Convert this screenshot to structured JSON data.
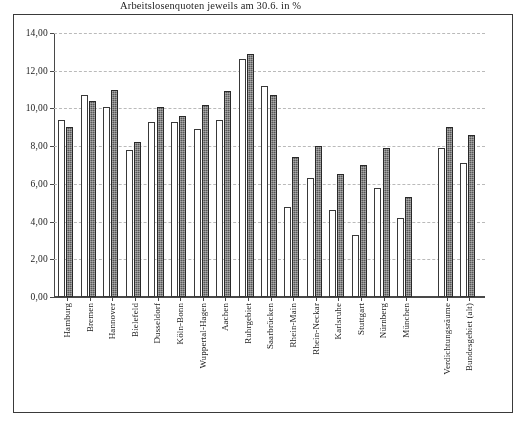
{
  "chart_data": {
    "type": "bar",
    "title": "Arbeitslosenquoten jeweils am 30.6. in %",
    "xlabel": "",
    "ylabel": "",
    "ylim": [
      0.0,
      14.0
    ],
    "ytick_labels": [
      "0,00",
      "2,00",
      "4,00",
      "6,00",
      "8,00",
      "10,00",
      "12,00",
      "14,00"
    ],
    "ytick_values": [
      0,
      2,
      4,
      6,
      8,
      10,
      12,
      14
    ],
    "grid": true,
    "legend_position": "none",
    "categories": [
      "Hamburg",
      "Bremen",
      "Hannover",
      "Bielefeld",
      "Dusseldorf",
      "Köln-Bonn",
      "Wuppertal-Hagen",
      "Aachen",
      "Ruhrgebiet",
      "Saarbrücken",
      "Rhein-Main",
      "Rhein-Neckar",
      "Karlsruhe",
      "Stuttgart",
      "Nürnberg",
      "München",
      "Verdichtungsräume",
      "Bundesgebiet (alt)"
    ],
    "series": [
      {
        "name": "series-1",
        "values": [
          9.4,
          10.7,
          10.1,
          7.8,
          9.3,
          9.3,
          8.9,
          9.4,
          12.6,
          11.2,
          4.8,
          6.3,
          4.6,
          3.3,
          5.8,
          4.2,
          7.9,
          7.1
        ]
      },
      {
        "name": "series-2",
        "values": [
          9.0,
          10.4,
          11.0,
          8.2,
          10.1,
          9.6,
          10.2,
          10.9,
          12.9,
          10.7,
          7.4,
          8.0,
          6.5,
          7.0,
          7.9,
          5.3,
          9.0,
          8.6
        ]
      }
    ]
  }
}
